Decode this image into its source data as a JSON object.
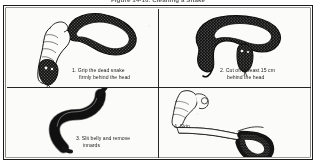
{
  "figure": {
    "title": "Figure 14-10. Cleaning a Snake",
    "border_color": "#1b1b1b",
    "ink_color": "#161616",
    "paper_color": "#fbfbf9"
  },
  "panels": [
    {
      "number": "1",
      "illustration": "hand-gripping-snake-head-illustration",
      "caption_line1": "1. Grip the dead snake",
      "caption_line2": "firmly behind the head"
    },
    {
      "number": "2",
      "illustration": "coiled-snake-severed-head-illustration",
      "caption_line1": "2. Cut off at least 15 cm",
      "caption_line2": "behind the head"
    },
    {
      "number": "3",
      "illustration": "headless-snake-body-illustration",
      "caption_line1": "3. Slit belly and remove",
      "caption_line2": "innards"
    },
    {
      "number": "4",
      "illustration": "hands-skinning-snake-illustration",
      "caption_line1": "4. Skin",
      "caption_line2": ""
    }
  ]
}
